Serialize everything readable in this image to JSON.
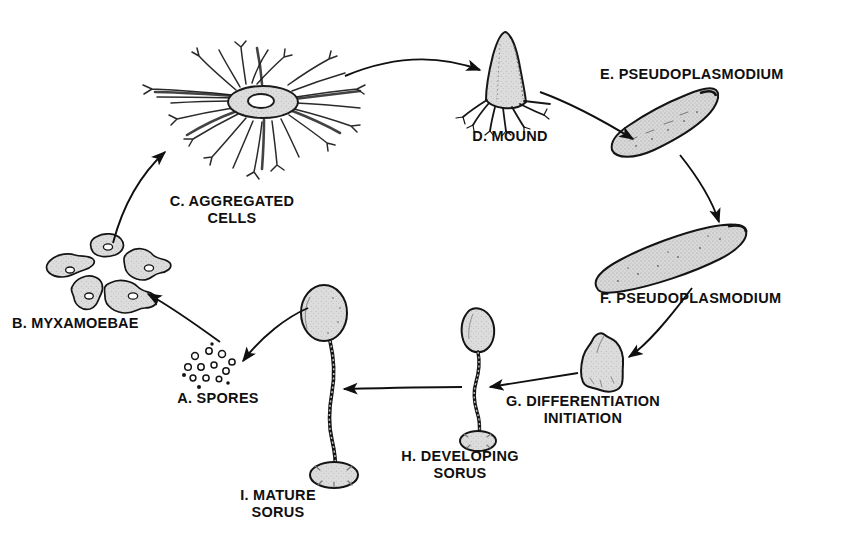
{
  "diagram": {
    "background_color": "#ffffff",
    "ink_color": "#101010",
    "fill_color": "#d9d9d9",
    "stages": [
      {
        "key": "a_spores",
        "label": "A. SPORES",
        "icon": "spores-cluster-icon"
      },
      {
        "key": "b_myxamoebae",
        "label": "B. MYXAMOEBAE",
        "icon": "amoeba-cells-icon"
      },
      {
        "key": "c_aggregated",
        "label": "C. AGGREGATED\nCELLS",
        "icon": "aggregation-star-icon"
      },
      {
        "key": "d_mound",
        "label": "D. MOUND",
        "icon": "mound-icon"
      },
      {
        "key": "e_pseudo",
        "label": "E. PSEUDOPLASMODIUM",
        "icon": "slug-tilted-icon"
      },
      {
        "key": "f_pseudo",
        "label": "F. PSEUDOPLASMODIUM",
        "icon": "slug-migrating-icon"
      },
      {
        "key": "g_diff",
        "label": "G. DIFFERENTIATION\nINITIATION",
        "icon": "culminant-blob-icon"
      },
      {
        "key": "h_developing",
        "label": "H. DEVELOPING\nSORUS",
        "icon": "developing-sorocarp-icon"
      },
      {
        "key": "i_mature",
        "label": "I. MATURE\nSORUS",
        "icon": "mature-sorocarp-icon"
      }
    ],
    "arrows": [
      {
        "from": "a_spores",
        "to": "b_myxamoebae"
      },
      {
        "from": "b_myxamoebae",
        "to": "c_aggregated"
      },
      {
        "from": "c_aggregated",
        "to": "d_mound"
      },
      {
        "from": "d_mound",
        "to": "e_pseudo"
      },
      {
        "from": "e_pseudo",
        "to": "f_pseudo"
      },
      {
        "from": "f_pseudo",
        "to": "g_diff"
      },
      {
        "from": "g_diff",
        "to": "h_developing"
      },
      {
        "from": "h_developing",
        "to": "i_mature"
      },
      {
        "from": "i_mature",
        "to": "a_spores"
      }
    ]
  }
}
